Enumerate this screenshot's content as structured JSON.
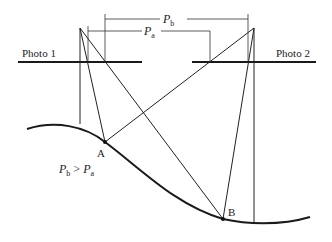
{
  "diagram": {
    "photo1": {
      "label": "Photo 1"
    },
    "photo2": {
      "label": "Photo 2"
    },
    "parallax_a": {
      "symbol": "P",
      "subscript": "a"
    },
    "parallax_b": {
      "symbol": "P",
      "subscript": "b"
    },
    "point_a": {
      "label": "A"
    },
    "point_b": {
      "label": "B"
    },
    "relation": {
      "left_symbol": "P",
      "left_sub": "b",
      "operator": " > ",
      "right_symbol": "P",
      "right_sub": "a"
    }
  }
}
